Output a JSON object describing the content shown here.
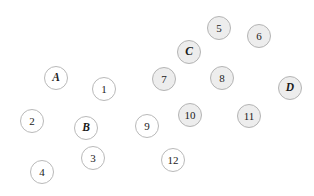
{
  "diagram": {
    "width": 314,
    "height": 196,
    "background_color": "#ffffff",
    "styles": {
      "plain_fill": "#ffffff",
      "plain_stroke": "#b9b9b9",
      "shaded_fill": "#ededed",
      "shaded_stroke": "#b4b4b4",
      "label_color": "#1b1b1b"
    },
    "nodes": [
      {
        "id": "node-5",
        "label": "5",
        "kind": "number",
        "style": "shaded",
        "cx": 219,
        "cy": 28,
        "r": 12
      },
      {
        "id": "node-6",
        "label": "6",
        "kind": "number",
        "style": "shaded",
        "cx": 259,
        "cy": 36,
        "r": 12
      },
      {
        "id": "node-C",
        "label": "C",
        "kind": "letter",
        "style": "shaded",
        "cx": 189,
        "cy": 52,
        "r": 12
      },
      {
        "id": "node-A",
        "label": "A",
        "kind": "letter",
        "style": "plain",
        "cx": 56,
        "cy": 78,
        "r": 12
      },
      {
        "id": "node-7",
        "label": "7",
        "kind": "number",
        "style": "shaded",
        "cx": 164,
        "cy": 79,
        "r": 12
      },
      {
        "id": "node-8",
        "label": "8",
        "kind": "number",
        "style": "shaded",
        "cx": 222,
        "cy": 78,
        "r": 12
      },
      {
        "id": "node-D",
        "label": "D",
        "kind": "letter",
        "style": "shaded",
        "cx": 290,
        "cy": 88,
        "r": 12
      },
      {
        "id": "node-1",
        "label": "1",
        "kind": "number",
        "style": "plain",
        "cx": 104,
        "cy": 89,
        "r": 12
      },
      {
        "id": "node-10",
        "label": "10",
        "kind": "number",
        "style": "shaded",
        "cx": 190,
        "cy": 115,
        "r": 12
      },
      {
        "id": "node-11",
        "label": "11",
        "kind": "number",
        "style": "shaded",
        "cx": 249,
        "cy": 116,
        "r": 12
      },
      {
        "id": "node-2",
        "label": "2",
        "kind": "number",
        "style": "plain",
        "cx": 32,
        "cy": 121,
        "r": 12
      },
      {
        "id": "node-9",
        "label": "9",
        "kind": "number",
        "style": "plain",
        "cx": 147,
        "cy": 126,
        "r": 12
      },
      {
        "id": "node-B",
        "label": "B",
        "kind": "letter",
        "style": "plain",
        "cx": 86,
        "cy": 128,
        "r": 12
      },
      {
        "id": "node-3",
        "label": "3",
        "kind": "number",
        "style": "plain",
        "cx": 93,
        "cy": 158,
        "r": 12
      },
      {
        "id": "node-12",
        "label": "12",
        "kind": "number",
        "style": "plain",
        "cx": 173,
        "cy": 160,
        "r": 12
      },
      {
        "id": "node-4",
        "label": "4",
        "kind": "number",
        "style": "plain",
        "cx": 42,
        "cy": 172,
        "r": 12
      }
    ]
  }
}
